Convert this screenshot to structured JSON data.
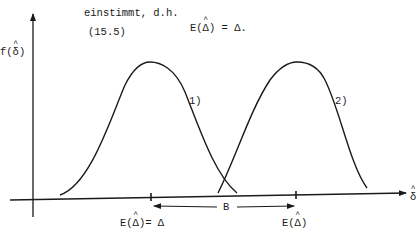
{
  "text": {
    "line1": "einstimmt, d.h.",
    "eq_number": "(15.5)",
    "equation_prefix": "E(",
    "equation_hat_symbol": "Δ",
    "equation_suffix": ") = Δ."
  },
  "axes": {
    "y_label_prefix": "f(",
    "y_label_symbol": "δ",
    "y_label_suffix": ")",
    "x_label_symbol": "δ"
  },
  "curves": [
    {
      "label": "1)",
      "peak_x": 150
    },
    {
      "label": "2)",
      "peak_x": 297
    }
  ],
  "annotations": {
    "bias_label": "B",
    "tick1_prefix": "E(",
    "tick1_symbol": "Δ",
    "tick1_suffix": ")= Δ",
    "tick2_prefix": "E(",
    "tick2_symbol": "Δ",
    "tick2_suffix": ")"
  },
  "colors": {
    "ink": "#1a1a1a",
    "background": "#ffffff"
  }
}
